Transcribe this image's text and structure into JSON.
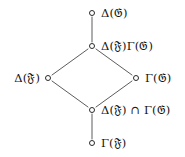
{
  "figure": {
    "kind": "hasse-diagram",
    "background_color": "#ffffff",
    "line_color": "#4a4a4a",
    "node_fill": "#ffffff",
    "node_stroke": "#2b2b2b",
    "text_color": "#121212"
  },
  "nodes": [
    {
      "id": "top",
      "label": "Δ(𝔊)",
      "label_side": "right",
      "x": 92,
      "y": 13,
      "label_x": 101,
      "label_y": 13
    },
    {
      "id": "upper-middle",
      "label": "Δ(𝔉)Γ(𝔊)",
      "label_side": "right",
      "x": 92,
      "y": 46,
      "label_x": 101,
      "label_y": 46
    },
    {
      "id": "left",
      "label": "Δ(𝔉)",
      "label_side": "left",
      "x": 48,
      "y": 78,
      "label_x": 40,
      "label_y": 78
    },
    {
      "id": "right",
      "label": "Γ(𝔊)",
      "label_side": "right",
      "x": 136,
      "y": 78,
      "label_x": 145,
      "label_y": 78
    },
    {
      "id": "lower-middle",
      "label": "Δ(𝔉) ∩ Γ(𝔊)",
      "label_side": "right",
      "x": 92,
      "y": 110,
      "label_x": 101,
      "label_y": 110
    },
    {
      "id": "bottom",
      "label": "Γ(𝔉)",
      "label_side": "right",
      "x": 92,
      "y": 143,
      "label_x": 101,
      "label_y": 143
    }
  ],
  "edges": [
    {
      "from": "top",
      "to": "upper-middle",
      "x1": 92,
      "y1": 17,
      "x2": 92,
      "y2": 42
    },
    {
      "from": "upper-middle",
      "to": "left",
      "x1": 88,
      "y1": 49,
      "x2": 52,
      "y2": 75
    },
    {
      "from": "upper-middle",
      "to": "right",
      "x1": 96,
      "y1": 49,
      "x2": 132,
      "y2": 75
    },
    {
      "from": "left",
      "to": "lower-middle",
      "x1": 52,
      "y1": 81,
      "x2": 88,
      "y2": 107
    },
    {
      "from": "right",
      "to": "lower-middle",
      "x1": 132,
      "y1": 81,
      "x2": 96,
      "y2": 107
    },
    {
      "from": "lower-middle",
      "to": "bottom",
      "x1": 92,
      "y1": 114,
      "x2": 92,
      "y2": 139
    }
  ],
  "symbols": {
    "delta": "Δ",
    "gamma": "Γ",
    "intersection": "∩",
    "fraktur_f": "𝔉",
    "fraktur_g": "𝔊"
  }
}
